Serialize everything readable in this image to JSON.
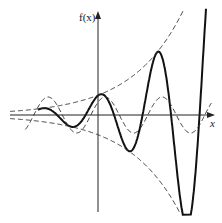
{
  "chart_data": {
    "type": "line",
    "title": "",
    "xlabel": "x",
    "ylabel": "f(x)",
    "xlim": [
      -9.7,
      12.7
    ],
    "ylim": [
      -5.3,
      5.7
    ],
    "grid": false,
    "legend": "none",
    "series": [
      {
        "name": "f(x) = A·e^(kx)·sin(x − φ)",
        "style": "solid",
        "formula": {
          "A": 1.1,
          "k": 0.177,
          "omega": 1,
          "phase": -1.37
        }
      },
      {
        "name": "upper envelope A·e^(kx)",
        "style": "dashed",
        "formula": {
          "A": 1.1,
          "k": 0.177,
          "sign": 1
        }
      },
      {
        "name": "lower envelope −A·e^(kx)",
        "style": "dashed",
        "formula": {
          "A": 1.1,
          "k": 0.177,
          "sign": -1
        }
      },
      {
        "name": "sin(x − φ)",
        "style": "dashed",
        "formula": {
          "A": 1,
          "omega": 1,
          "phase": -0.79
        }
      }
    ]
  },
  "labels": {
    "y_axis": "f(x)",
    "x_axis": "x"
  }
}
